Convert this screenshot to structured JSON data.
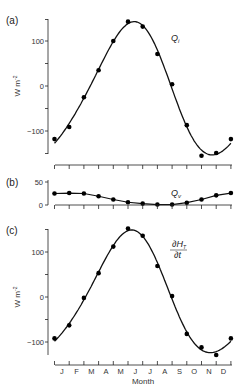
{
  "chart_data": [
    {
      "panel": "(a)",
      "type": "line",
      "series_label": "Q_i",
      "ylabel": "W m⁻²",
      "ylim": [
        -160,
        160
      ],
      "yticks": [
        -100,
        0,
        100
      ],
      "x": [
        "J",
        "F",
        "M",
        "A",
        "M",
        "J",
        "J",
        "A",
        "S",
        "O",
        "N",
        "D",
        "J"
      ],
      "series": [
        {
          "name": "observed",
          "kind": "scatter",
          "values": [
            -118,
            -91,
            -25,
            35,
            100,
            143,
            132,
            71,
            4,
            -87,
            -155,
            -149,
            -118
          ]
        },
        {
          "name": "fit",
          "kind": "line"
        }
      ]
    },
    {
      "panel": "(b)",
      "type": "line",
      "series_label": "Q_v",
      "ylim": [
        0,
        55
      ],
      "yticks": [
        0,
        50
      ],
      "x": [
        "J",
        "F",
        "M",
        "A",
        "M",
        "J",
        "J",
        "A",
        "S",
        "O",
        "N",
        "D",
        "J"
      ],
      "series": [
        {
          "name": "observed",
          "kind": "scatter+line",
          "values": [
            25,
            26,
            25,
            19,
            12,
            6,
            3,
            1,
            1,
            5,
            12,
            21,
            26
          ]
        }
      ]
    },
    {
      "panel": "(c)",
      "type": "line",
      "series_label": "∂H_T/∂t",
      "ylabel": "W m⁻²",
      "xlabel": "Month",
      "ylim": [
        -160,
        160
      ],
      "yticks": [
        -100,
        0,
        100
      ],
      "x": [
        "J",
        "F",
        "M",
        "A",
        "M",
        "J",
        "J",
        "A",
        "S",
        "O",
        "N",
        "D",
        "J"
      ],
      "series": [
        {
          "name": "observed",
          "kind": "scatter",
          "values": [
            -92,
            -63,
            -2,
            53,
            112,
            152,
            136,
            69,
            2,
            -82,
            -112,
            -129,
            -92
          ]
        },
        {
          "name": "fit",
          "kind": "line"
        }
      ]
    }
  ],
  "labels": {
    "panel_a": "(a)",
    "panel_b": "(b)",
    "panel_c": "(c)",
    "ylabel": "W m",
    "ylabel_exp": "-2",
    "xlabel": "Month",
    "qi_main": "Q",
    "qi_sub": "i",
    "qv_main": "Q",
    "qv_sub": "v",
    "dht_num": "∂H",
    "dht_sub": "T",
    "dht_den": "∂t",
    "tick_100": "100",
    "tick_0": "0",
    "tick_m100": "−100",
    "tick_50": "50",
    "months": [
      "J",
      "F",
      "M",
      "A",
      "M",
      "J",
      "J",
      "A",
      "S",
      "O",
      "N",
      "D"
    ]
  }
}
